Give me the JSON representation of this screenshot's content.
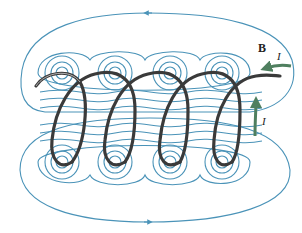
{
  "diagram": {
    "labels": {
      "field": "B",
      "current_top": "I",
      "current_side": "I"
    },
    "colors": {
      "field_lines": "#4a93b8",
      "wire": "#3a3a3a",
      "current_arrow": "#4f7f5f",
      "background": "#ffffff"
    },
    "solenoid": {
      "loops": 4,
      "top_cross_sections_x": [
        62,
        115,
        170,
        222
      ],
      "top_cross_section_y": 73,
      "bottom_cross_sections_x": [
        62,
        115,
        170,
        222
      ],
      "bottom_cross_section_y": 162
    }
  }
}
